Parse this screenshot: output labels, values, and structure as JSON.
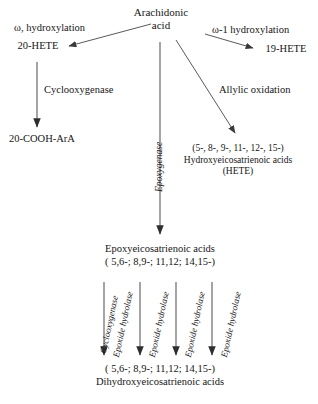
{
  "diagram": {
    "background_color": "#ffffff",
    "line_color": "#5a5a5a",
    "text_color": "#151515"
  },
  "nodes": {
    "arachidonic_acid": {
      "line1": "Arachidonic",
      "line2": "acid"
    },
    "hete_20": "20-HETE",
    "hete_19": "19-HETE",
    "cooh_ara": "20-COOH-ArA",
    "hydroxyeicosatrienoic": {
      "line1": "(5-, 8-, 9-, 11-, 12-, 15-)",
      "line2": "Hydroxyeicosatrienoic acids",
      "line3": "(HETE)"
    },
    "epoxyeicosatrienoic": {
      "line1": "Epoxyeicosatrienoic acids",
      "line2": "( 5,6-; 8,9-; 11,12; 14,15-)"
    },
    "dihydroxyeicosatrienoic": {
      "line1": "( 5,6-; 8,9-; 11,12; 14,15-)",
      "line2": "Dihydroxyeicosatrienoic acids"
    }
  },
  "edge_labels": {
    "omega_hydroxylation": "ω, hydroxylation",
    "omega_1_hydroxylation": "ω-1 hydroxylation",
    "cyclooxygenase_left": "Cyclooxygenase",
    "allylic_oxidation": "Allylic oxidation",
    "epoxygenase": "Epoxygenase",
    "cyclooxygenase_bottom": "Cyclooxygenase",
    "epoxide_hydrolase_1": "Epoxide hydrolase",
    "epoxide_hydrolase_2": "Epoxide hydrolase",
    "epoxide_hydrolase_3": "Epoxide hydrolase",
    "epoxide_hydrolase_4": "Epoxide hydrolase"
  }
}
